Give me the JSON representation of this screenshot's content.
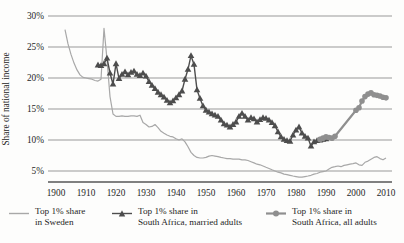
{
  "figure": {
    "background": "#fdfdfc",
    "text_color": "#262626",
    "gridline_color": "#999999",
    "axis_color": "#808080"
  },
  "chart_data": {
    "type": "line",
    "title": "",
    "xlabel": "",
    "ylabel": "Share of national income",
    "grid": "horizontal",
    "legend_position": "bottom",
    "xlim": [
      1897,
      2012
    ],
    "ylim": [
      3.2,
      30
    ],
    "x_tick_labels": [
      "1900",
      "1910",
      "1920",
      "1930",
      "1940",
      "1950",
      "1960",
      "1970",
      "1980",
      "1990",
      "2000",
      "2010"
    ],
    "x_tick_values": [
      1900,
      1910,
      1920,
      1930,
      1940,
      1950,
      1960,
      1970,
      1980,
      1990,
      2000,
      2010
    ],
    "y_tick_labels": [
      "30%",
      "25%",
      "20%",
      "15%",
      "10%",
      "5%"
    ],
    "y_tick_values": [
      30,
      25,
      20,
      15,
      10,
      5
    ],
    "series": [
      {
        "name": "Top 1% share in Sweden",
        "marker": "none",
        "color": "#a8a8a8",
        "line_width": 1.2,
        "points": [
          [
            1903,
            27.8
          ],
          [
            1904,
            25.5
          ],
          [
            1905,
            23.8
          ],
          [
            1906,
            22.4
          ],
          [
            1907,
            21.3
          ],
          [
            1908,
            20.5
          ],
          [
            1909,
            20.1
          ],
          [
            1910,
            20.0
          ],
          [
            1911,
            19.9
          ],
          [
            1912,
            19.8
          ],
          [
            1913,
            19.6
          ],
          [
            1914,
            19.5
          ],
          [
            1915,
            19.8
          ],
          [
            1916,
            28.0
          ],
          [
            1917,
            23.0
          ],
          [
            1918,
            17.0
          ],
          [
            1919,
            14.2
          ],
          [
            1920,
            13.8
          ],
          [
            1921,
            13.8
          ],
          [
            1922,
            13.9
          ],
          [
            1923,
            13.8
          ],
          [
            1924,
            13.8
          ],
          [
            1925,
            13.9
          ],
          [
            1926,
            13.9
          ],
          [
            1927,
            13.8
          ],
          [
            1928,
            14.0
          ],
          [
            1929,
            12.8
          ],
          [
            1930,
            12.5
          ],
          [
            1931,
            12.1
          ],
          [
            1932,
            12.2
          ],
          [
            1933,
            12.5
          ],
          [
            1934,
            12.0
          ],
          [
            1935,
            11.4
          ],
          [
            1936,
            11.1
          ],
          [
            1937,
            10.8
          ],
          [
            1938,
            10.6
          ],
          [
            1939,
            10.5
          ],
          [
            1940,
            10.2
          ],
          [
            1941,
            10.0
          ],
          [
            1942,
            10.2
          ],
          [
            1943,
            9.7
          ],
          [
            1944,
            8.9
          ],
          [
            1945,
            8.0
          ],
          [
            1946,
            7.5
          ],
          [
            1947,
            7.2
          ],
          [
            1948,
            7.1
          ],
          [
            1949,
            7.1
          ],
          [
            1950,
            7.2
          ],
          [
            1951,
            7.4
          ],
          [
            1952,
            7.5
          ],
          [
            1953,
            7.4
          ],
          [
            1954,
            7.3
          ],
          [
            1955,
            7.2
          ],
          [
            1956,
            7.1
          ],
          [
            1957,
            7.0
          ],
          [
            1958,
            7.0
          ],
          [
            1959,
            6.9
          ],
          [
            1960,
            6.9
          ],
          [
            1961,
            6.9
          ],
          [
            1962,
            6.8
          ],
          [
            1963,
            6.8
          ],
          [
            1964,
            6.7
          ],
          [
            1965,
            6.5
          ],
          [
            1966,
            6.3
          ],
          [
            1967,
            6.1
          ],
          [
            1968,
            6.0
          ],
          [
            1969,
            5.8
          ],
          [
            1970,
            5.6
          ],
          [
            1971,
            5.4
          ],
          [
            1972,
            5.2
          ],
          [
            1973,
            5.0
          ],
          [
            1974,
            4.8
          ],
          [
            1975,
            4.7
          ],
          [
            1976,
            4.5
          ],
          [
            1977,
            4.4
          ],
          [
            1978,
            4.3
          ],
          [
            1979,
            4.2
          ],
          [
            1980,
            4.1
          ],
          [
            1981,
            4.0
          ],
          [
            1982,
            4.0
          ],
          [
            1983,
            4.1
          ],
          [
            1984,
            4.2
          ],
          [
            1985,
            4.3
          ],
          [
            1986,
            4.5
          ],
          [
            1987,
            4.6
          ],
          [
            1988,
            4.8
          ],
          [
            1989,
            4.9
          ],
          [
            1990,
            5.0
          ],
          [
            1991,
            5.3
          ],
          [
            1992,
            5.6
          ],
          [
            1993,
            5.7
          ],
          [
            1994,
            5.8
          ],
          [
            1995,
            5.7
          ],
          [
            1996,
            5.9
          ],
          [
            1997,
            6.0
          ],
          [
            1998,
            6.1
          ],
          [
            1999,
            6.2
          ],
          [
            2000,
            6.3
          ],
          [
            2001,
            6.0
          ],
          [
            2002,
            5.9
          ],
          [
            2003,
            6.4
          ],
          [
            2004,
            6.6
          ],
          [
            2005,
            6.9
          ],
          [
            2006,
            7.2
          ],
          [
            2007,
            7.3
          ],
          [
            2008,
            7.0
          ],
          [
            2009,
            6.8
          ],
          [
            2010,
            7.1
          ]
        ]
      },
      {
        "name": "Top 1% share in South Africa, married adults",
        "marker": "triangle",
        "color": "#4d4d4d",
        "line_width": 1.4,
        "points": [
          [
            1914,
            22.1
          ],
          [
            1915,
            22.0
          ],
          [
            1916,
            22.3
          ],
          [
            1917,
            23.2
          ],
          [
            1918,
            20.8
          ],
          [
            1919,
            19.0
          ],
          [
            1920,
            22.3
          ],
          [
            1921,
            19.9
          ],
          [
            1922,
            20.6
          ],
          [
            1923,
            21.0
          ],
          [
            1924,
            20.5
          ],
          [
            1925,
            20.9
          ],
          [
            1926,
            21.1
          ],
          [
            1927,
            20.6
          ],
          [
            1928,
            20.4
          ],
          [
            1929,
            20.8
          ],
          [
            1930,
            20.3
          ],
          [
            1931,
            19.4
          ],
          [
            1932,
            18.8
          ],
          [
            1933,
            18.3
          ],
          [
            1934,
            17.7
          ],
          [
            1935,
            17.3
          ],
          [
            1936,
            16.9
          ],
          [
            1937,
            16.4
          ],
          [
            1938,
            16.0
          ],
          [
            1939,
            16.3
          ],
          [
            1940,
            16.8
          ],
          [
            1941,
            17.3
          ],
          [
            1942,
            17.9
          ],
          [
            1943,
            19.8
          ],
          [
            1944,
            21.4
          ],
          [
            1945,
            23.6
          ],
          [
            1946,
            22.2
          ],
          [
            1947,
            18.1
          ],
          [
            1948,
            16.7
          ],
          [
            1949,
            15.5
          ],
          [
            1950,
            14.8
          ],
          [
            1951,
            14.5
          ],
          [
            1952,
            14.2
          ],
          [
            1953,
            14.0
          ],
          [
            1954,
            13.8
          ],
          [
            1955,
            13.2
          ],
          [
            1956,
            12.6
          ],
          [
            1957,
            12.4
          ],
          [
            1958,
            12.1
          ],
          [
            1959,
            12.5
          ],
          [
            1960,
            12.9
          ],
          [
            1961,
            13.8
          ],
          [
            1962,
            14.3
          ],
          [
            1963,
            13.8
          ],
          [
            1964,
            13.2
          ],
          [
            1965,
            13.6
          ],
          [
            1966,
            13.4
          ],
          [
            1967,
            12.9
          ],
          [
            1968,
            13.3
          ],
          [
            1969,
            13.6
          ],
          [
            1970,
            13.5
          ],
          [
            1971,
            13.2
          ],
          [
            1972,
            12.8
          ],
          [
            1973,
            12.3
          ],
          [
            1974,
            11.3
          ],
          [
            1975,
            10.5
          ],
          [
            1976,
            10.1
          ],
          [
            1977,
            9.9
          ],
          [
            1978,
            9.8
          ],
          [
            1979,
            10.8
          ],
          [
            1980,
            11.6
          ],
          [
            1981,
            12.1
          ],
          [
            1982,
            11.1
          ],
          [
            1983,
            10.6
          ],
          [
            1984,
            10.3
          ],
          [
            1985,
            9.0
          ],
          [
            1986,
            9.7
          ],
          [
            1987,
            9.9
          ],
          [
            1988,
            10.0
          ],
          [
            1989,
            10.1
          ],
          [
            1990,
            10.2
          ]
        ]
      },
      {
        "name": "Top 1% share in South Africa, all adults",
        "marker": "circle",
        "color": "#8f8f8f",
        "line_width": 2.2,
        "points": [
          [
            1988,
            10.1
          ],
          [
            1989,
            10.3
          ],
          [
            1990,
            10.5
          ],
          [
            1991,
            10.4
          ],
          [
            1992,
            10.3
          ],
          [
            1993,
            10.6
          ],
          [
            2000,
            14.8
          ],
          [
            2001,
            15.2
          ],
          [
            2002,
            16.3
          ],
          [
            2003,
            17.0
          ],
          [
            2004,
            17.4
          ],
          [
            2005,
            17.6
          ],
          [
            2006,
            17.3
          ],
          [
            2007,
            17.2
          ],
          [
            2008,
            17.1
          ],
          [
            2009,
            16.9
          ],
          [
            2010,
            16.8
          ]
        ]
      }
    ]
  },
  "legend": {
    "items": [
      {
        "marker": "line",
        "label_line1": "Top 1% share",
        "label_line2": "in Sweden"
      },
      {
        "marker": "line-triangle",
        "label_line1": "Top 1% share in",
        "label_line2": "South Africa, married adults"
      },
      {
        "marker": "line-circle",
        "label_line1": "Top 1% share in",
        "label_line2": "South Africa, all adults"
      }
    ]
  }
}
